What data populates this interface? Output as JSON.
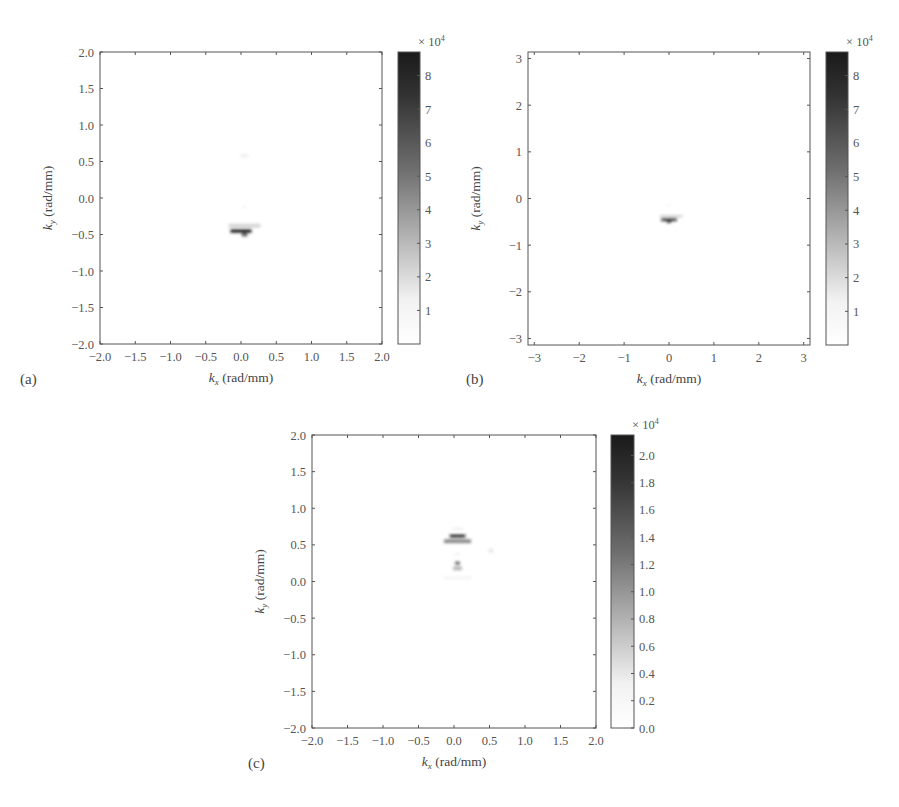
{
  "chart_data": [
    {
      "type": "heatmap",
      "panel_label": "(a)",
      "xlabel_main": "k",
      "xlabel_sub": "x",
      "xlabel_unit": " (rad/mm)",
      "ylabel_main": "k",
      "ylabel_sub": "y",
      "ylabel_unit": " (rad/mm)",
      "xlim": [
        -2.0,
        2.0
      ],
      "ylim": [
        -2.0,
        2.0
      ],
      "xticks": [
        "-2.0",
        "-1.5",
        "-1.0",
        "-0.5",
        "0.0",
        "0.5",
        "1.0",
        "1.5",
        "2.0"
      ],
      "yticks": [
        "-2.0",
        "-1.5",
        "-1.0",
        "-0.5",
        "0.0",
        "0.5",
        "1.0",
        "1.5",
        "2.0"
      ],
      "colorbar": {
        "multiplier": "× 10",
        "exponent": "4",
        "range": [
          0,
          8.7
        ],
        "ticks": [
          "1",
          "2",
          "3",
          "4",
          "5",
          "6",
          "7",
          "8"
        ]
      },
      "colormap": "gray_r",
      "grid": false,
      "features": [
        {
          "kx": 0.0,
          "ky": -0.45,
          "wx": 0.3,
          "wy": 0.05,
          "intensity": 1.0
        },
        {
          "kx": 0.05,
          "ky": -0.5,
          "wx": 0.08,
          "wy": 0.05,
          "intensity": 0.75
        },
        {
          "kx": 0.05,
          "ky": -0.38,
          "wx": 0.45,
          "wy": 0.05,
          "intensity": 0.2
        },
        {
          "kx": 0.05,
          "ky": 0.58,
          "wx": 0.12,
          "wy": 0.04,
          "intensity": 0.08
        },
        {
          "kx": 0.05,
          "ky": -0.12,
          "wx": 0.03,
          "wy": 0.03,
          "intensity": 0.1
        }
      ]
    },
    {
      "type": "heatmap",
      "panel_label": "(b)",
      "xlabel_main": "k",
      "xlabel_sub": "x",
      "xlabel_unit": " (rad/mm)",
      "ylabel_main": "k",
      "ylabel_sub": "y",
      "ylabel_unit": " (rad/mm)",
      "xlim": [
        -3.14,
        3.14
      ],
      "ylim": [
        -3.14,
        3.14
      ],
      "xticks": [
        "-3",
        "-2",
        "-1",
        "0",
        "1",
        "2",
        "3"
      ],
      "yticks": [
        "-3",
        "-2",
        "-1",
        "0",
        "1",
        "2",
        "3"
      ],
      "colorbar": {
        "multiplier": "× 10",
        "exponent": "4",
        "range": [
          0,
          8.7
        ],
        "ticks": [
          "1",
          "2",
          "3",
          "4",
          "5",
          "6",
          "7",
          "8"
        ]
      },
      "colormap": "gray_r",
      "grid": false,
      "features": [
        {
          "kx": 0.0,
          "ky": -0.45,
          "wx": 0.35,
          "wy": 0.06,
          "intensity": 1.0
        },
        {
          "kx": 0.0,
          "ky": -0.5,
          "wx": 0.1,
          "wy": 0.05,
          "intensity": 0.8
        },
        {
          "kx": 0.05,
          "ky": -0.38,
          "wx": 0.5,
          "wy": 0.05,
          "intensity": 0.2
        },
        {
          "kx": 0.0,
          "ky": -0.15,
          "wx": 0.04,
          "wy": 0.04,
          "intensity": 0.08
        }
      ]
    },
    {
      "type": "heatmap",
      "panel_label": "(c)",
      "xlabel_main": "k",
      "xlabel_sub": "x",
      "xlabel_unit": " (rad/mm)",
      "ylabel_main": "k",
      "ylabel_sub": "y",
      "ylabel_unit": " (rad/mm)",
      "xlim": [
        -2.0,
        2.0
      ],
      "ylim": [
        -2.0,
        2.0
      ],
      "xticks": [
        "-2.0",
        "-1.5",
        "-1.0",
        "-0.5",
        "0.0",
        "0.5",
        "1.0",
        "1.5",
        "2.0"
      ],
      "yticks": [
        "-2.0",
        "-1.5",
        "-1.0",
        "-0.5",
        "0.0",
        "0.5",
        "1.0",
        "1.5",
        "2.0"
      ],
      "colorbar": {
        "multiplier": "× 10",
        "exponent": "4",
        "range": [
          0,
          2.15
        ],
        "ticks": [
          "0.0",
          "0.2",
          "0.4",
          "0.6",
          "0.8",
          "1.0",
          "1.2",
          "1.4",
          "1.6",
          "1.8",
          "2.0"
        ]
      },
      "colormap": "gray_r",
      "grid": false,
      "features": [
        {
          "kx": 0.05,
          "ky": 0.62,
          "wx": 0.22,
          "wy": 0.04,
          "intensity": 1.0
        },
        {
          "kx": 0.05,
          "ky": 0.55,
          "wx": 0.38,
          "wy": 0.05,
          "intensity": 0.55
        },
        {
          "kx": 0.05,
          "ky": 0.25,
          "wx": 0.06,
          "wy": 0.04,
          "intensity": 0.8
        },
        {
          "kx": 0.05,
          "ky": 0.18,
          "wx": 0.12,
          "wy": 0.05,
          "intensity": 0.35
        },
        {
          "kx": 0.05,
          "ky": 0.72,
          "wx": 0.15,
          "wy": 0.03,
          "intensity": 0.08
        },
        {
          "kx": 0.52,
          "ky": 0.42,
          "wx": 0.06,
          "wy": 0.05,
          "intensity": 0.12
        },
        {
          "kx": 0.05,
          "ky": 0.05,
          "wx": 0.4,
          "wy": 0.03,
          "intensity": 0.06
        },
        {
          "kx": 0.05,
          "ky": 0.38,
          "wx": 0.05,
          "wy": 0.02,
          "intensity": 0.1
        }
      ]
    }
  ]
}
